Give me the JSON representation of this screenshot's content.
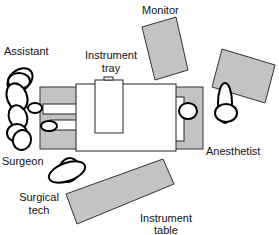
{
  "diagram": {
    "colors": {
      "equipment_fill": "#c3c3c3",
      "outline": "#000000",
      "background": "#ffffff"
    },
    "labels": {
      "monitor": "Monitor",
      "assistant": "Assistant",
      "instrument_tray_line1": "Instrument",
      "instrument_tray_line2": "tray",
      "anesthetist": "Anesthetist",
      "surgeon": "Surgeon",
      "surgical_tech_line1": "Surgical",
      "surgical_tech_line2": "tech",
      "instrument_table_line1": "Instrument",
      "instrument_table_line2": "table"
    },
    "roles": [
      "Assistant",
      "Surgeon",
      "Surgical tech",
      "Anesthetist"
    ],
    "equipment": [
      "Monitor",
      "Anesthesia machine",
      "Operating table",
      "Instrument tray",
      "Instrument table"
    ]
  }
}
